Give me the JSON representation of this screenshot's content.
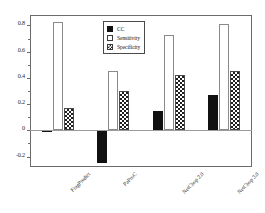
{
  "chart_data": {
    "type": "bar",
    "title": "",
    "subtitle": "",
    "xlabel": "",
    "ylabel": "",
    "categories": [
      "FragPredict",
      "PaProC",
      "NetChop 2.0",
      "NetChop 3.0"
    ],
    "series": [
      {
        "name": "CC",
        "values": [
          0.0,
          -0.25,
          0.15,
          0.27
        ]
      },
      {
        "name": "Sensitivity",
        "values": [
          0.83,
          0.45,
          0.73,
          0.81
        ]
      },
      {
        "name": "Specificity",
        "values": [
          0.17,
          0.3,
          0.42,
          0.45
        ]
      }
    ],
    "ylim": [
      -0.28,
      0.88
    ],
    "ytick_values": [
      0.8,
      0.6,
      0.4,
      0.2,
      0.0,
      -0.2
    ],
    "ytick_labels": [
      "0.8",
      "0.6",
      "0.4",
      "0.2",
      "0",
      "-0.2"
    ],
    "yminor_values": [
      0.7,
      0.5,
      0.3,
      0.1,
      -0.1
    ],
    "grid": false,
    "legend_position": "top-center",
    "legend_entries": [
      {
        "label": "CC",
        "marker": "filled-square"
      },
      {
        "label": "Sensitivity",
        "marker": "empty-square"
      },
      {
        "label": "Specificity",
        "marker": "hatched-square"
      }
    ],
    "colors": {
      "cc": "#111111",
      "sensitivity": "#ffffff",
      "specificity_hatch": "#1f1f1f",
      "axis": "#6b6b6b",
      "background": "#ffffff"
    }
  }
}
